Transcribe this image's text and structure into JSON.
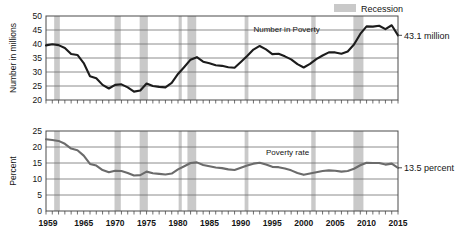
{
  "legend": {
    "items": [
      {
        "label": "Recession",
        "color": "#c9c9c9",
        "swatch_name": "recession-swatch"
      }
    ]
  },
  "colors": {
    "recession_band": "#c9c9c9",
    "poverty_number_line": "#1c1c1c",
    "poverty_rate_line": "#6b6b6b",
    "grid": "#6e6e6e",
    "axis": "#4a4a4a",
    "background": "#ffffff"
  },
  "annotations": {
    "top_series_label": "Number in Poverty",
    "bottom_series_label": "Poverty rate",
    "top_end_label": "43.1 million",
    "bottom_end_label": "13.5 percent"
  },
  "chart_data": [
    {
      "id": "number-in-poverty",
      "type": "line",
      "title": "",
      "xlabel": "",
      "ylabel": "Number in millions",
      "xlim": [
        1959,
        2015
      ],
      "ylim": [
        20,
        50
      ],
      "yticks": [
        20,
        25,
        30,
        35,
        40,
        45,
        50
      ],
      "xticks": [
        1959,
        1965,
        1970,
        1975,
        1980,
        1985,
        1990,
        1995,
        2000,
        2005,
        2010,
        2015
      ],
      "xtick_labels": [
        "1959",
        "1965",
        "1970",
        "1975",
        "1980",
        "1985",
        "1990",
        "1995",
        "2000",
        "2005",
        "2010",
        "2015"
      ],
      "grid": true,
      "legend_position": "top-right",
      "series": [
        {
          "name": "Number in Poverty",
          "units": "millions",
          "x": [
            1959,
            1960,
            1961,
            1962,
            1963,
            1964,
            1965,
            1966,
            1967,
            1968,
            1969,
            1970,
            1971,
            1972,
            1973,
            1974,
            1975,
            1976,
            1977,
            1978,
            1979,
            1980,
            1981,
            1982,
            1983,
            1984,
            1985,
            1986,
            1987,
            1988,
            1989,
            1990,
            1991,
            1992,
            1993,
            1994,
            1995,
            1996,
            1997,
            1998,
            1999,
            2000,
            2001,
            2002,
            2003,
            2004,
            2005,
            2006,
            2007,
            2008,
            2009,
            2010,
            2011,
            2012,
            2013,
            2014,
            2015
          ],
          "values": [
            39.5,
            39.9,
            39.6,
            38.6,
            36.4,
            36.1,
            33.2,
            28.5,
            27.8,
            25.4,
            24.1,
            25.4,
            25.6,
            24.5,
            23.0,
            23.4,
            25.9,
            25.0,
            24.7,
            24.5,
            26.1,
            29.3,
            31.8,
            34.4,
            35.3,
            33.7,
            33.1,
            32.4,
            32.2,
            31.7,
            31.5,
            33.6,
            35.7,
            38.0,
            39.3,
            38.1,
            36.4,
            36.5,
            35.6,
            34.5,
            32.8,
            31.6,
            32.9,
            34.6,
            35.9,
            37.0,
            37.0,
            36.5,
            37.3,
            39.8,
            43.6,
            46.3,
            46.2,
            46.5,
            45.3,
            46.7,
            43.1
          ]
        }
      ],
      "recession_bands": [
        {
          "start": 1960.3,
          "end": 1961.2
        },
        {
          "start": 1969.9,
          "end": 1970.9
        },
        {
          "start": 1973.9,
          "end": 1975.2
        },
        {
          "start": 1980.1,
          "end": 1980.6
        },
        {
          "start": 1981.5,
          "end": 1982.9
        },
        {
          "start": 1990.6,
          "end": 1991.2
        },
        {
          "start": 2001.2,
          "end": 2001.9
        },
        {
          "start": 2007.9,
          "end": 2009.5
        }
      ],
      "end_label": "43.1 million",
      "end_value": 43.1,
      "series_label": "Number in Poverty"
    },
    {
      "id": "poverty-rate",
      "type": "line",
      "title": "",
      "xlabel": "",
      "ylabel": "Percent",
      "xlim": [
        1959,
        2015
      ],
      "ylim": [
        0,
        25
      ],
      "yticks": [
        0,
        5,
        10,
        15,
        20,
        25
      ],
      "xticks": [
        1959,
        1965,
        1970,
        1975,
        1980,
        1985,
        1990,
        1995,
        2000,
        2005,
        2010,
        2015
      ],
      "xtick_labels": [
        "1959",
        "1965",
        "1970",
        "1975",
        "1980",
        "1985",
        "1990",
        "1995",
        "2000",
        "2005",
        "2010",
        "2015"
      ],
      "grid": true,
      "legend_position": "none",
      "series": [
        {
          "name": "Poverty rate",
          "units": "percent",
          "x": [
            1959,
            1960,
            1961,
            1962,
            1963,
            1964,
            1965,
            1966,
            1967,
            1968,
            1969,
            1970,
            1971,
            1972,
            1973,
            1974,
            1975,
            1976,
            1977,
            1978,
            1979,
            1980,
            1981,
            1982,
            1983,
            1984,
            1985,
            1986,
            1987,
            1988,
            1989,
            1990,
            1991,
            1992,
            1993,
            1994,
            1995,
            1996,
            1997,
            1998,
            1999,
            2000,
            2001,
            2002,
            2003,
            2004,
            2005,
            2006,
            2007,
            2008,
            2009,
            2010,
            2011,
            2012,
            2013,
            2014,
            2015
          ],
          "values": [
            22.4,
            22.2,
            21.9,
            21.0,
            19.5,
            19.0,
            17.3,
            14.7,
            14.2,
            12.8,
            12.1,
            12.6,
            12.5,
            11.9,
            11.1,
            11.2,
            12.3,
            11.8,
            11.6,
            11.4,
            11.7,
            13.0,
            14.0,
            15.0,
            15.2,
            14.4,
            14.0,
            13.6,
            13.4,
            13.0,
            12.8,
            13.5,
            14.2,
            14.8,
            15.1,
            14.5,
            13.8,
            13.7,
            13.3,
            12.7,
            11.9,
            11.3,
            11.7,
            12.1,
            12.5,
            12.7,
            12.6,
            12.3,
            12.5,
            13.2,
            14.3,
            15.1,
            15.0,
            15.0,
            14.5,
            14.8,
            13.5
          ]
        }
      ],
      "recession_bands": [
        {
          "start": 1960.3,
          "end": 1961.2
        },
        {
          "start": 1969.9,
          "end": 1970.9
        },
        {
          "start": 1973.9,
          "end": 1975.2
        },
        {
          "start": 1980.1,
          "end": 1980.6
        },
        {
          "start": 1981.5,
          "end": 1982.9
        },
        {
          "start": 1990.6,
          "end": 1991.2
        },
        {
          "start": 2001.2,
          "end": 2001.9
        },
        {
          "start": 2007.9,
          "end": 2009.5
        }
      ],
      "end_label": "13.5 percent",
      "end_value": 13.5,
      "series_label": "Poverty rate"
    }
  ]
}
